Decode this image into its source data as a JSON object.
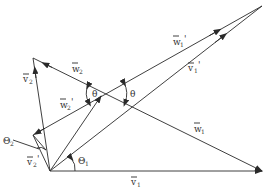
{
  "diagram": {
    "type": "vector velocity triangle diagram",
    "labels": {
      "v1": "v⃗1",
      "v1_prime": "v⃗1'",
      "v2": "v⃗2",
      "v2_prime": "v⃗2'",
      "w1": "w⃗1",
      "w1_prime": "w⃗1'",
      "w2": "w⃗2",
      "w2_prime": "w⃗2'",
      "theta": "θ",
      "theta1": "Θ1",
      "theta2": "Θ2"
    },
    "text": {
      "v": "v",
      "w": "w",
      "one": "1",
      "two": "2",
      "prime": "'",
      "theta": "θ",
      "Theta": "Θ"
    },
    "stroke_color": "#2a2a2a",
    "background": "#ffffff"
  }
}
